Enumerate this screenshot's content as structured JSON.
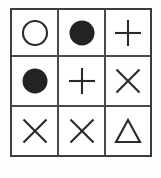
{
  "figure": {
    "rows": 3,
    "columns": 3,
    "background_color": "#ffffff",
    "border_color": "#3c3c3c",
    "gridline_color": "#4a4a4a",
    "symbol_color": "#2a2a2a",
    "cells": [
      {
        "row": 1,
        "column": 1,
        "symbol": "circle-outline",
        "label": "circle-outline-icon"
      },
      {
        "row": 1,
        "column": 2,
        "symbol": "circle-filled",
        "label": "circle-filled-icon"
      },
      {
        "row": 1,
        "column": 3,
        "symbol": "plus",
        "label": "plus-icon"
      },
      {
        "row": 2,
        "column": 1,
        "symbol": "circle-filled",
        "label": "circle-filled-icon"
      },
      {
        "row": 2,
        "column": 2,
        "symbol": "plus",
        "label": "plus-icon"
      },
      {
        "row": 2,
        "column": 3,
        "symbol": "cross-x",
        "label": "cross-x-icon"
      },
      {
        "row": 3,
        "column": 1,
        "symbol": "cross-x",
        "label": "cross-x-icon"
      },
      {
        "row": 3,
        "column": 2,
        "symbol": "cross-x",
        "label": "cross-x-icon"
      },
      {
        "row": 3,
        "column": 3,
        "symbol": "triangle-outline",
        "label": "triangle-outline-icon"
      }
    ]
  }
}
